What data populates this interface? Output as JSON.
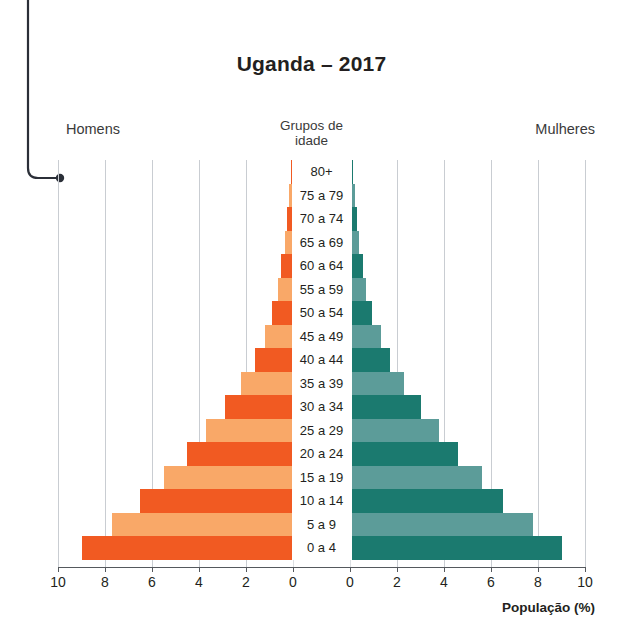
{
  "title": "Uganda – 2017",
  "labels": {
    "men": "Homens",
    "women": "Mulheres",
    "center_heading_line1": "Grupos de",
    "center_heading_line2": "idade",
    "axis_title": "População (%)"
  },
  "colors": {
    "men_dark": "#F15A22",
    "men_light": "#F9A868",
    "women_dark": "#1B7A6F",
    "women_light": "#5C9C99",
    "gridline": "#c9cdd2",
    "axis": "#55595d",
    "text": "#231f20"
  },
  "axis": {
    "ticks_left": [
      "10",
      "8",
      "6",
      "4",
      "2",
      "0"
    ],
    "ticks_right": [
      "0",
      "2",
      "4",
      "6",
      "8",
      "10"
    ],
    "max": 10
  },
  "chart_data": {
    "type": "bar",
    "subtype": "population-pyramid",
    "title": "Uganda – 2017",
    "xlabel": "População (%)",
    "ylabel": "Grupos de idade",
    "xlim": [
      0,
      10
    ],
    "grid": true,
    "categories": [
      "80+",
      "75 a 79",
      "70 a 74",
      "65 a 69",
      "60 a 64",
      "55 a 59",
      "50 a 54",
      "45 a 49",
      "40 a 44",
      "35 a 39",
      "30 a 34",
      "25 a 29",
      "20 a 24",
      "15 a 19",
      "10 a 14",
      "5 a 9",
      "0 a 4"
    ],
    "series": [
      {
        "name": "Homens",
        "side": "left",
        "values": [
          0.1,
          0.15,
          0.25,
          0.35,
          0.5,
          0.65,
          0.9,
          1.2,
          1.6,
          2.2,
          2.9,
          3.7,
          4.5,
          5.5,
          6.5,
          7.7,
          9.0
        ]
      },
      {
        "name": "Mulheres",
        "side": "right",
        "values": [
          0.12,
          0.2,
          0.3,
          0.4,
          0.55,
          0.7,
          0.95,
          1.3,
          1.7,
          2.3,
          3.0,
          3.8,
          4.6,
          5.6,
          6.5,
          7.8,
          9.0
        ]
      }
    ]
  }
}
